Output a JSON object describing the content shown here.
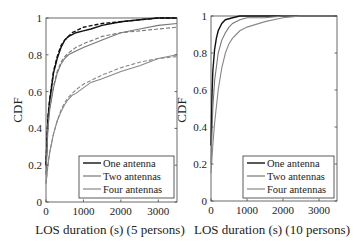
{
  "chart_data": [
    {
      "type": "line",
      "title": "",
      "xlabel": "LOS duration (s) (5 persons)",
      "ylabel": "CDF",
      "xlim": [
        0,
        3500
      ],
      "ylim": [
        0,
        1
      ],
      "xticks": [
        "0",
        "1000",
        "2000",
        "3000"
      ],
      "yticks": [
        "0",
        "0.2",
        "0.4",
        "0.6",
        "0.8",
        "1"
      ],
      "grid": false,
      "legend_position": "lower right",
      "legend": [
        "One antenna",
        "Two antennas",
        "Four antennas"
      ],
      "series": [
        {
          "name": "One antenna",
          "style": "solid",
          "color": "#111111",
          "x": [
            0,
            50,
            100,
            200,
            300,
            400,
            500,
            600,
            700,
            800,
            1000,
            1200,
            1500,
            2000,
            2500,
            3000,
            3500
          ],
          "y": [
            0.2,
            0.45,
            0.55,
            0.7,
            0.78,
            0.84,
            0.88,
            0.9,
            0.91,
            0.92,
            0.93,
            0.94,
            0.96,
            0.98,
            0.99,
            1.0,
            1.0
          ]
        },
        {
          "name": "One antenna (model)",
          "style": "dashed",
          "color": "#111111",
          "x": [
            0,
            50,
            100,
            200,
            300,
            400,
            500,
            600,
            700,
            800,
            1000,
            1500,
            2000,
            2500,
            3000,
            3500
          ],
          "y": [
            0.2,
            0.46,
            0.56,
            0.71,
            0.79,
            0.85,
            0.88,
            0.9,
            0.92,
            0.93,
            0.95,
            0.97,
            0.98,
            0.99,
            1.0,
            1.0
          ]
        },
        {
          "name": "Two antennas",
          "style": "solid",
          "color": "#777777",
          "x": [
            0,
            50,
            100,
            200,
            300,
            400,
            500,
            600,
            800,
            1000,
            1500,
            2000,
            2500,
            3000,
            3500
          ],
          "y": [
            0.15,
            0.4,
            0.5,
            0.62,
            0.7,
            0.75,
            0.78,
            0.8,
            0.82,
            0.84,
            0.88,
            0.92,
            0.94,
            0.96,
            0.97
          ]
        },
        {
          "name": "Two antennas (model)",
          "style": "dashed",
          "color": "#777777",
          "x": [
            0,
            50,
            100,
            200,
            300,
            400,
            500,
            600,
            800,
            1000,
            1500,
            2000,
            2500,
            3000,
            3500
          ],
          "y": [
            0.15,
            0.41,
            0.51,
            0.63,
            0.71,
            0.76,
            0.79,
            0.81,
            0.84,
            0.86,
            0.9,
            0.92,
            0.93,
            0.94,
            0.95
          ]
        },
        {
          "name": "Four antennas",
          "style": "solid",
          "color": "#888888",
          "x": [
            0,
            50,
            100,
            200,
            300,
            400,
            500,
            600,
            700,
            800,
            1000,
            1200,
            1500,
            2000,
            2500,
            3000,
            3500
          ],
          "y": [
            0.1,
            0.2,
            0.27,
            0.37,
            0.44,
            0.49,
            0.53,
            0.56,
            0.58,
            0.59,
            0.62,
            0.65,
            0.67,
            0.71,
            0.74,
            0.78,
            0.8
          ]
        },
        {
          "name": "Four antennas (model)",
          "style": "dashed",
          "color": "#888888",
          "x": [
            0,
            50,
            100,
            200,
            300,
            400,
            500,
            600,
            800,
            1000,
            1500,
            2000,
            2500,
            3000,
            3500
          ],
          "y": [
            0.1,
            0.2,
            0.27,
            0.37,
            0.44,
            0.5,
            0.54,
            0.57,
            0.61,
            0.64,
            0.69,
            0.73,
            0.76,
            0.78,
            0.79
          ]
        }
      ]
    },
    {
      "type": "line",
      "title": "",
      "xlabel": "LOS duration (s) (10 persons)",
      "ylabel": "CDF",
      "xlim": [
        0,
        3500
      ],
      "ylim": [
        0,
        1
      ],
      "xticks": [
        "0",
        "1000",
        "2000",
        "3000"
      ],
      "yticks": [
        "0",
        "0.2",
        "0.4",
        "0.6",
        "0.8",
        "1"
      ],
      "grid": false,
      "legend_position": "lower right",
      "legend": [
        "One antenna",
        "Two antennas",
        "Four antennas"
      ],
      "series": [
        {
          "name": "One antenna",
          "style": "solid",
          "color": "#111111",
          "x": [
            0,
            25,
            50,
            100,
            150,
            200,
            300,
            400,
            600,
            800,
            1000,
            1500,
            2000,
            3000,
            3500
          ],
          "y": [
            0.3,
            0.55,
            0.7,
            0.82,
            0.88,
            0.92,
            0.96,
            0.98,
            0.99,
            1.0,
            1.0,
            1.0,
            1.0,
            1.0,
            1.0
          ]
        },
        {
          "name": "Two antennas",
          "style": "solid",
          "color": "#777777",
          "x": [
            0,
            50,
            100,
            200,
            300,
            400,
            500,
            600,
            800,
            1000,
            1500,
            2000,
            2500,
            3000,
            3500
          ],
          "y": [
            0.2,
            0.5,
            0.65,
            0.8,
            0.87,
            0.91,
            0.94,
            0.96,
            0.98,
            0.99,
            0.99,
            1.0,
            1.0,
            1.0,
            1.0
          ]
        },
        {
          "name": "Four antennas",
          "style": "solid",
          "color": "#888888",
          "x": [
            0,
            50,
            100,
            200,
            300,
            400,
            500,
            600,
            700,
            800,
            1000,
            1500,
            2000,
            2500,
            3000,
            3500
          ],
          "y": [
            0.15,
            0.3,
            0.42,
            0.6,
            0.72,
            0.8,
            0.85,
            0.88,
            0.9,
            0.92,
            0.94,
            0.97,
            0.99,
            1.0,
            1.0,
            1.0
          ]
        }
      ]
    }
  ]
}
